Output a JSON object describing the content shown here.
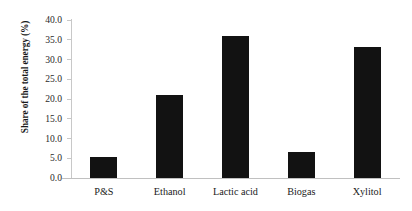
{
  "chart_data": {
    "type": "bar",
    "title": "",
    "subtitle": "",
    "xlabel": "",
    "ylabel": "Share of the total energy (%)",
    "categories": [
      "P&S",
      "Ethanol",
      "Lactic acid",
      "Biogas",
      "Xylitol"
    ],
    "values": [
      5.3,
      21.0,
      36.0,
      6.5,
      33.2
    ],
    "ylim": [
      0.0,
      40.0
    ],
    "ytick_step": 5.0,
    "ytick_labels": [
      "0.0",
      "5.0",
      "10.0",
      "15.0",
      "20.0",
      "25.0",
      "30.0",
      "35.0",
      "40.0"
    ],
    "ytick_values": [
      0.0,
      5.0,
      10.0,
      15.0,
      20.0,
      25.0,
      30.0,
      35.0,
      40.0
    ],
    "grid": false,
    "legend": false,
    "legend_position": "none",
    "bar_color": "#121212",
    "axis_color": "#c8c8c8",
    "background_color": "#ffffff",
    "annotations": []
  }
}
